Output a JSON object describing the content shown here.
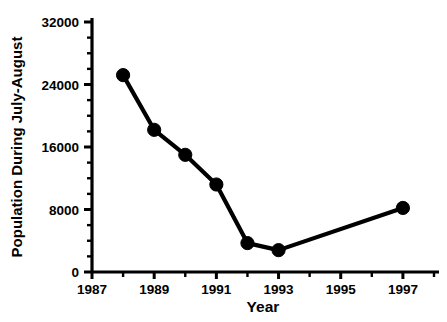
{
  "chart_data": {
    "type": "line",
    "title": "",
    "xlabel": "Year",
    "ylabel": "Population During July-August",
    "x": [
      1988,
      1989,
      1990,
      1991,
      1992,
      1993,
      1997
    ],
    "values": [
      25200,
      18200,
      15000,
      11200,
      3700,
      2800,
      8200
    ],
    "series": [
      {
        "name": "Population",
        "x": [
          1988,
          1989,
          1990,
          1991,
          1992,
          1993,
          1997
        ],
        "values": [
          25200,
          18200,
          15000,
          11200,
          3700,
          2800,
          8200
        ]
      }
    ],
    "xlim": [
      1987,
      1998
    ],
    "ylim": [
      0,
      32000
    ],
    "y_major_ticks": [
      0,
      8000,
      16000,
      24000,
      32000
    ],
    "y_tick_labels": [
      "0",
      "8000",
      "16000",
      "24000",
      "32000"
    ],
    "y_minor_tick_interval": 2000,
    "x_major_ticks": [
      1987,
      1989,
      1991,
      1993,
      1995,
      1997
    ],
    "x_tick_labels": [
      "1987",
      "1989",
      "1991",
      "1993",
      "1995",
      "1997"
    ],
    "x_minor_ticks": [
      1988,
      1990,
      1992,
      1994,
      1996,
      1998
    ],
    "grid": false,
    "legend": false,
    "legend_position": "none",
    "marker": "filled-circle",
    "marker_color": "#000000",
    "line_color": "#000000"
  }
}
